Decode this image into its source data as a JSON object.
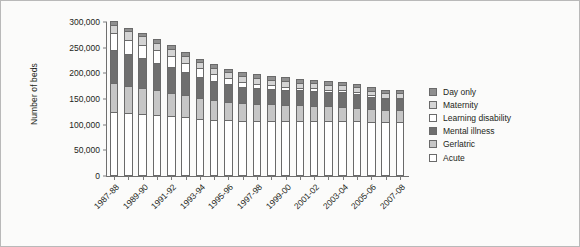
{
  "chart_data": {
    "type": "bar",
    "stacked": true,
    "title": "",
    "xlabel": "",
    "ylabel": "Number of beds",
    "ylim": [
      0,
      300000
    ],
    "ytick_values": [
      0,
      50000,
      100000,
      150000,
      200000,
      250000,
      300000
    ],
    "ytick_labels": [
      "0",
      "50,000",
      "100,000",
      "150,000",
      "200,000",
      "250,000",
      "300,000"
    ],
    "grid": false,
    "legend_position": "right",
    "xlabel_rotation": -45,
    "xlabel_interval": 2,
    "categories": [
      "1987-88",
      "1988-89",
      "1989-90",
      "1990-91",
      "1991-92",
      "1992-93",
      "1993-94",
      "1994-95",
      "1995-96",
      "1996-97",
      "1997-98",
      "1998-99",
      "1999-00",
      "2000-01",
      "2001-02",
      "2002-03",
      "2003-04",
      "2004-05",
      "2005-06",
      "2006-07",
      "2007-08"
    ],
    "tick_labels": [
      "1987-88",
      "",
      "1989-90",
      "",
      "1991-92",
      "",
      "1993-94",
      "",
      "1995-96",
      "",
      "1997-98",
      "",
      "1999-00",
      "",
      "2001-02",
      "",
      "2003-04",
      "",
      "2005-06",
      "",
      "2007-08"
    ],
    "series": [
      {
        "name": "Acute",
        "color": "#ffffff",
        "values": [
          125000,
          123000,
          121000,
          119000,
          117000,
          114000,
          111000,
          110000,
          109000,
          108000,
          108000,
          108000,
          108000,
          108000,
          108000,
          108000,
          108000,
          107000,
          106000,
          105000,
          105000
        ]
      },
      {
        "name": "Gerlatric",
        "color": "#c6c6c6",
        "values": [
          56000,
          52000,
          50000,
          48000,
          45000,
          43000,
          41000,
          38000,
          36000,
          34000,
          33000,
          32000,
          31000,
          30000,
          29000,
          28000,
          27000,
          26000,
          25000,
          24000,
          24000
        ]
      },
      {
        "name": "Mental illness",
        "color": "#6f6f6f",
        "values": [
          65000,
          62000,
          58000,
          54000,
          50000,
          45000,
          41000,
          37000,
          34000,
          32000,
          31000,
          30000,
          29000,
          29000,
          29000,
          28000,
          28000,
          27000,
          23000,
          21000,
          21000
        ]
      },
      {
        "name": "Learning disability",
        "color": "#ffffff",
        "values": [
          32000,
          29000,
          27000,
          24000,
          22000,
          19000,
          17000,
          14000,
          12000,
          10000,
          8000,
          7000,
          6000,
          5000,
          5000,
          4000,
          4000,
          3000,
          3000,
          2000,
          2000
        ]
      },
      {
        "name": "Maternity",
        "color": "#d4d4d4",
        "values": [
          17000,
          16000,
          16000,
          15000,
          14000,
          13000,
          12000,
          12000,
          11000,
          11000,
          11000,
          11000,
          11000,
          10000,
          10000,
          10000,
          10000,
          10000,
          9000,
          9000,
          9000
        ]
      },
      {
        "name": "Day only",
        "color": "#8f8f8f",
        "values": [
          7000,
          7000,
          7000,
          7000,
          7000,
          7000,
          7000,
          7000,
          7000,
          7000,
          7000,
          7000,
          7000,
          7000,
          7000,
          7000,
          7000,
          7000,
          7000,
          7000,
          7000
        ]
      }
    ],
    "legend_order": [
      "Day only",
      "Maternity",
      "Learning disability",
      "Mental illness",
      "Gerlatric",
      "Acute"
    ]
  }
}
